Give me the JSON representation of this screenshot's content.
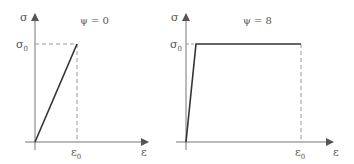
{
  "left_panel": {
    "title": "ψ = 0",
    "y_axis_label": "σ",
    "x_axis_label": "ε",
    "y_mark": {
      "sym": "σ",
      "sub": "0"
    },
    "x_mark": {
      "sym": "ε",
      "sub": "0"
    }
  },
  "right_panel": {
    "title": "ψ = 8",
    "y_axis_label": "σ",
    "x_axis_label": "ε",
    "y_mark": {
      "sym": "σ",
      "sub": "0"
    },
    "x_mark": {
      "sym": "ε",
      "sub": "0"
    }
  },
  "colors": {
    "axis": "#777777",
    "curve": "#333333",
    "dashed": "#999999"
  }
}
